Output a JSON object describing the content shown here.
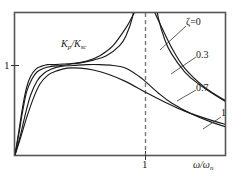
{
  "chart_data": {
    "type": "line",
    "title": "",
    "subtitle": "",
    "xlabel": "ω/ω",
    "xlabel_sub": "n",
    "ylabel": "K",
    "ylabel_sub1": "p",
    "ylabel_sub2": "sc",
    "ylabel_full": "K_p/K_sc",
    "xlim": [
      0,
      2.6
    ],
    "ylim": [
      0,
      2.6
    ],
    "grid": false,
    "legend_position": "right-inline-labels",
    "xticks": [
      {
        "value": 1,
        "label": "1"
      }
    ],
    "yticks": [
      {
        "value": 1,
        "label": "1"
      }
    ],
    "annotations": [
      {
        "name": "resonance-dashed-line",
        "type": "vline",
        "x": 1,
        "style": "dashed"
      }
    ],
    "series": [
      {
        "name": "ζ=0",
        "label": "ζ=0",
        "damping_ratio": 0,
        "color": "#1a1a1a",
        "x": [
          0.0,
          0.03,
          0.06,
          0.09,
          0.12,
          0.16,
          0.2,
          0.25,
          0.3,
          0.4,
          0.5,
          0.6,
          0.7,
          0.8,
          0.85,
          0.9,
          0.93,
          0.95,
          0.97,
          0.98,
          1.0,
          1.02,
          1.03,
          1.05,
          1.07,
          1.1,
          1.15,
          1.2,
          1.3,
          1.4,
          1.6,
          1.8,
          2.0,
          2.2,
          2.4,
          2.6
        ],
        "y": [
          0.0,
          0.27,
          0.55,
          0.76,
          0.88,
          0.96,
          0.99,
          1.01,
          1.01,
          1.02,
          1.03,
          1.06,
          1.11,
          1.22,
          1.33,
          1.54,
          1.83,
          2.1,
          2.6,
          3.2,
          9.99,
          3.2,
          2.6,
          2.1,
          1.8,
          1.52,
          1.28,
          1.13,
          0.93,
          0.8,
          0.61,
          0.48,
          0.38,
          0.3,
          0.23,
          0.17
        ]
      },
      {
        "name": "0.3",
        "label": "0.3",
        "damping_ratio": 0.3,
        "color": "#1a1a1a",
        "x": [
          0.0,
          0.03,
          0.06,
          0.09,
          0.13,
          0.17,
          0.22,
          0.28,
          0.35,
          0.45,
          0.55,
          0.65,
          0.75,
          0.85,
          0.9,
          0.95,
          1.0,
          1.05,
          1.1,
          1.2,
          1.3,
          1.45,
          1.6,
          1.8,
          2.0,
          2.2,
          2.4,
          2.6
        ],
        "y": [
          0.0,
          0.24,
          0.5,
          0.71,
          0.85,
          0.93,
          0.97,
          0.99,
          1.0,
          1.02,
          1.05,
          1.11,
          1.22,
          1.42,
          1.55,
          1.68,
          1.72,
          1.65,
          1.5,
          1.2,
          0.97,
          0.76,
          0.62,
          0.47,
          0.37,
          0.29,
          0.23,
          0.18
        ]
      },
      {
        "name": "0.7",
        "label": "0.7",
        "damping_ratio": 0.7,
        "color": "#1a1a1a",
        "x": [
          0.0,
          0.04,
          0.08,
          0.12,
          0.17,
          0.22,
          0.28,
          0.35,
          0.45,
          0.55,
          0.65,
          0.75,
          0.85,
          0.95,
          1.0,
          1.1,
          1.2,
          1.35,
          1.5,
          1.7,
          1.9,
          2.1,
          2.3,
          2.5,
          2.6
        ],
        "y": [
          0.0,
          0.21,
          0.46,
          0.67,
          0.83,
          0.91,
          0.96,
          0.99,
          1.0,
          1.01,
          1.01,
          1.0,
          0.97,
          0.88,
          0.82,
          0.69,
          0.58,
          0.46,
          0.37,
          0.28,
          0.22,
          0.18,
          0.14,
          0.12,
          0.11
        ]
      },
      {
        "name": "1",
        "label": "1",
        "damping_ratio": 1,
        "color": "#1a1a1a",
        "x": [
          0.0,
          0.04,
          0.09,
          0.14,
          0.19,
          0.25,
          0.32,
          0.4,
          0.5,
          0.6,
          0.72,
          0.85,
          1.0,
          1.15,
          1.3,
          1.5,
          1.7,
          1.9,
          2.1,
          2.3,
          2.5,
          2.6
        ],
        "y": [
          0.0,
          0.18,
          0.42,
          0.63,
          0.79,
          0.89,
          0.94,
          0.97,
          0.97,
          0.95,
          0.9,
          0.82,
          0.7,
          0.59,
          0.49,
          0.39,
          0.31,
          0.25,
          0.2,
          0.17,
          0.14,
          0.13
        ]
      }
    ],
    "leader_lines": [
      {
        "name": "leader-zeta0",
        "from": [
          186,
          26
        ],
        "to": [
          160,
          50
        ]
      },
      {
        "name": "leader-03",
        "from": [
          196,
          57
        ],
        "to": [
          171,
          74
        ]
      },
      {
        "name": "leader-07",
        "from": [
          196,
          90
        ],
        "to": [
          177,
          101
        ]
      },
      {
        "name": "leader-1",
        "from": [
          221,
          117
        ],
        "to": [
          203,
          129
        ]
      }
    ]
  },
  "labels": {
    "y_tick_1": "1",
    "x_tick_1": "1",
    "zeta_0": "ζ=0",
    "v_03": "0.3",
    "v_07": "0.7",
    "v_1": "1",
    "y_axis_K": "K",
    "y_axis_sub_p": "p",
    "y_axis_slash": "/K",
    "y_axis_sub_sc": "sc",
    "x_axis_omega": "ω/ω",
    "x_axis_sub_n": "n"
  },
  "style": {
    "frame_color": "#555555",
    "curve_color": "#1a1a1a",
    "dashed_color": "#777777",
    "background": "#ffffff"
  }
}
